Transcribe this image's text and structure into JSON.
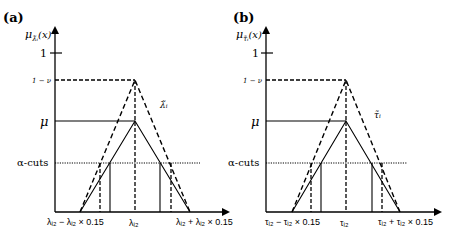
{
  "panels": [
    {
      "id": "a",
      "panel_label": "(a)",
      "y_axis_label": "μ",
      "y_axis_sub": "λ̃ᵢ",
      "y_axis_arg": "(x)",
      "y_ticks": {
        "one": "1",
        "one_minus_nu": "1 − ν",
        "mu": "μ",
        "alpha_cuts": "α-cuts"
      },
      "curve_label": "λ̃ᵢ",
      "x_ticks": {
        "left": "λᵢ₂ − λᵢ₂ × 0.15",
        "center": "λᵢ₂",
        "right": "λᵢ₂ + λᵢ₂ × 0.15"
      }
    },
    {
      "id": "b",
      "panel_label": "(b)",
      "y_axis_label": "μ",
      "y_axis_sub": "τ̃ᵢ",
      "y_axis_arg": "(x)",
      "y_ticks": {
        "one": "1",
        "one_minus_nu": "1 − ν",
        "mu": "μ",
        "alpha_cuts": "α-cuts"
      },
      "curve_label": "τ̃ᵢ",
      "x_ticks": {
        "left": "τᵢ₂ − τᵢ₂ × 0.15",
        "center": "τᵢ₂",
        "right": "τᵢ₂ + τᵢ₂ × 0.15"
      }
    }
  ]
}
